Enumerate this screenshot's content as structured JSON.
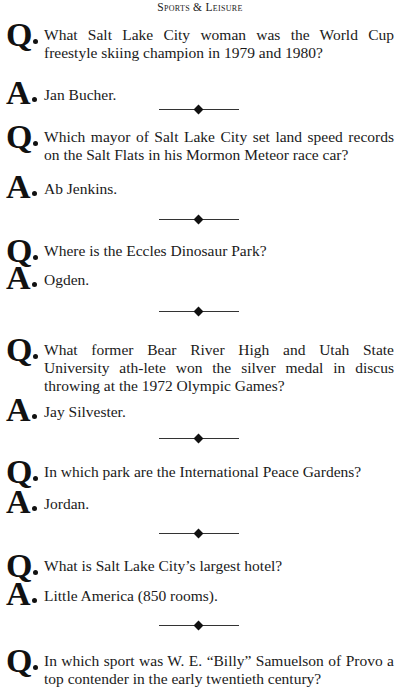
{
  "header": {
    "title": "Sports & Leisure"
  },
  "items": [
    {
      "q": "What Salt Lake City woman was the World Cup freestyle skiing champion in 1979 and 1980?",
      "a": "Jan Bucher."
    },
    {
      "q": "Which mayor of Salt Lake City set land speed records on the Salt Flats in his Mormon Meteor race car?",
      "a": "Ab Jenkins."
    },
    {
      "q": "Where is the Eccles Dinosaur Park?",
      "a": "Ogden."
    },
    {
      "q": "What former Bear River High and Utah State University ath-lete won the silver medal in discus throwing at the 1972 Olympic Games?",
      "a": "Jay Silvester."
    },
    {
      "q": "In which park are the International Peace Gardens?",
      "a": "Jordan."
    },
    {
      "q": "What is Salt Lake City’s largest hotel?",
      "a": "Little America (850 rooms)."
    },
    {
      "q": "In which sport was W. E. “Billy” Samuelson of Provo a top contender in the early twentieth century?",
      "a": null
    }
  ],
  "labels": {
    "question": "Q",
    "answer": "A"
  }
}
